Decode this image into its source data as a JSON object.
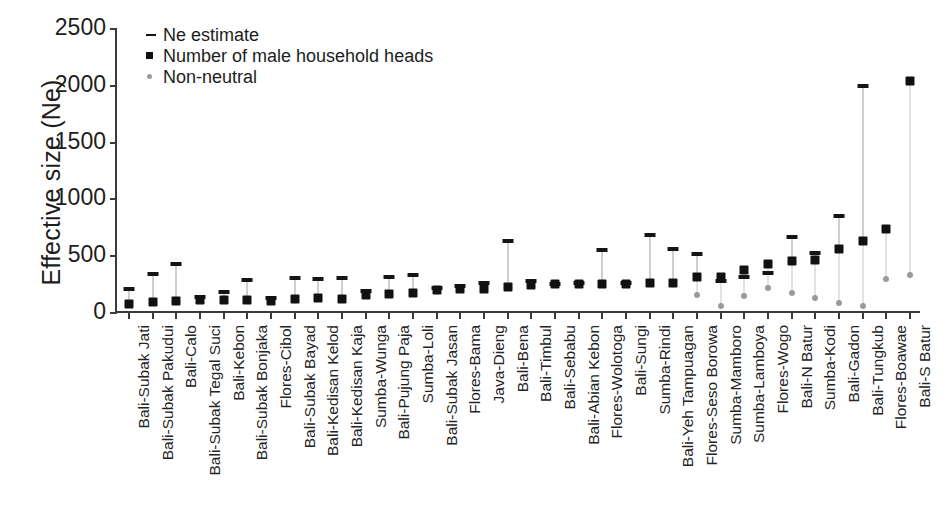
{
  "chart_data": {
    "type": "scatter",
    "title": "",
    "xlabel": "",
    "ylabel": "Effective size (Ne)",
    "ylim": [
      0,
      2500
    ],
    "yticks": [
      0,
      500,
      1000,
      1500,
      2000,
      2500
    ],
    "grid": false,
    "legend_position": "top-left",
    "legend": [
      {
        "key": "ne-dash",
        "label": "- Ne estimate",
        "text": "Ne estimate"
      },
      {
        "key": "hh-square",
        "label": "Number of male household heads",
        "text": "Number of male household heads"
      },
      {
        "key": "nn-dot",
        "label": "Non-neutral",
        "text": "Non-neutral"
      }
    ],
    "categories": [
      "Bali-Subak Jati",
      "Bali-Subak Pakudui",
      "Bali-Calo",
      "Bali-Subak Tegal Suci",
      "Bali-Kebon",
      "Bali-Subak Bonjaka",
      "Flores-Cibol",
      "Bali-Subak Bayad",
      "Bali-Kedisan Kelod",
      "Bali-Kedisan Kaja",
      "Sumba-Wunga",
      "Bali-Pujung Paja",
      "Sumba-Loli",
      "Bali-Subak Jasan",
      "Flores-Bama",
      "Java-Dieng",
      "Bali-Bena",
      "Bali-Timbul",
      "Bali-Sebabu",
      "Bali-Abian Kebon",
      "Flores-Wolotoga",
      "Bali-Sungi",
      "Sumba-Rindi",
      "Bali-Yeh Tampuagan",
      "Flores-Seso Borowa",
      "Sumba-Mamboro",
      "Sumba-Lamboya",
      "Flores-Wogo",
      "Bali-N Batur",
      "Sumba-Kodi",
      "Bali-Gadon",
      "Bali-Tungkub",
      "Flores-Boawae",
      "Bali-S Batur"
    ],
    "series": [
      {
        "name": "Number of male household heads",
        "marker": "square",
        "color": "#111111",
        "values": [
          65,
          80,
          85,
          100,
          95,
          95,
          90,
          110,
          115,
          105,
          140,
          150,
          160,
          185,
          195,
          195,
          215,
          225,
          235,
          235,
          240,
          240,
          245,
          250,
          300,
          300,
          360,
          410,
          440,
          450,
          545,
          615,
          725,
          2025
        ]
      },
      {
        "name": "Ne estimate",
        "marker": "dash",
        "color": "#151515",
        "values": [
          195,
          330,
          410,
          120,
          165,
          270,
          115,
          295,
          285,
          290,
          175,
          300,
          320,
          200,
          220,
          250,
          620,
          265,
          240,
          250,
          540,
          250,
          670,
          545,
          500,
          260,
          300,
          335,
          655,
          515,
          835,
          1985,
          null,
          null
        ]
      },
      {
        "name": "Non-neutral",
        "marker": "dot",
        "color": "#9a9a9a",
        "values": [
          null,
          null,
          null,
          null,
          null,
          null,
          null,
          null,
          null,
          null,
          null,
          null,
          null,
          null,
          null,
          null,
          null,
          null,
          null,
          null,
          null,
          null,
          null,
          null,
          140,
          40,
          130,
          205,
          155,
          115,
          70,
          40,
          280,
          320
        ]
      }
    ]
  },
  "yaxis": {
    "title": "Effective size (Ne)"
  }
}
